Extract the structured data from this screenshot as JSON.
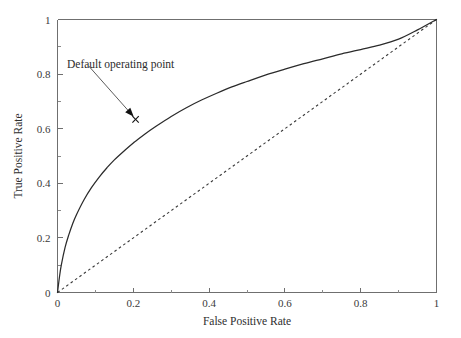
{
  "chart_data": {
    "type": "line",
    "title": "",
    "xlabel": "False Positive Rate",
    "ylabel": "True Positive Rate",
    "xlim": [
      0,
      1
    ],
    "ylim": [
      0,
      1
    ],
    "grid": false,
    "legend": "none",
    "x_ticks": [
      "0",
      "0.2",
      "0.4",
      "0.6",
      "0.8",
      "1"
    ],
    "x_tick_values": [
      0,
      0.2,
      0.4,
      0.6,
      0.8,
      1
    ],
    "y_ticks": [
      "0",
      "0.2",
      "0.4",
      "0.6",
      "0.8",
      "1"
    ],
    "y_tick_values": [
      0,
      0.2,
      0.4,
      0.6,
      0.8,
      1
    ],
    "minor_tick_step": 0.1,
    "series": [
      {
        "name": "ROC curve",
        "style": "solid",
        "color": "#2b2b2b",
        "x": [
          0,
          0.005,
          0.01,
          0.02,
          0.03,
          0.04,
          0.05,
          0.07,
          0.09,
          0.11,
          0.13,
          0.15,
          0.18,
          0.2,
          0.206,
          0.23,
          0.26,
          0.3,
          0.34,
          0.38,
          0.42,
          0.46,
          0.5,
          0.55,
          0.6,
          0.65,
          0.7,
          0.75,
          0.8,
          0.85,
          0.9,
          0.95,
          1
        ],
        "y": [
          0,
          0.055,
          0.1,
          0.165,
          0.212,
          0.252,
          0.285,
          0.34,
          0.385,
          0.423,
          0.456,
          0.486,
          0.524,
          0.548,
          0.554,
          0.58,
          0.609,
          0.645,
          0.677,
          0.705,
          0.73,
          0.753,
          0.773,
          0.797,
          0.818,
          0.838,
          0.856,
          0.874,
          0.89,
          0.906,
          0.928,
          0.962,
          1
        ]
      },
      {
        "name": "Chance line",
        "style": "dashed",
        "color": "#3a3a3a",
        "x": [
          0,
          1
        ],
        "y": [
          0,
          1
        ]
      }
    ],
    "annotations": [
      {
        "label": "Default operating point",
        "text_x": 0.045,
        "text_y": 0.845,
        "point_x": 0.206,
        "point_y": 0.634,
        "marker": "x",
        "arrow": "down-right"
      }
    ]
  },
  "axes": {
    "x_title": "False Positive Rate",
    "y_title": "True Positive Rate"
  },
  "annotation": {
    "operating_point_label": "Default operating point"
  }
}
